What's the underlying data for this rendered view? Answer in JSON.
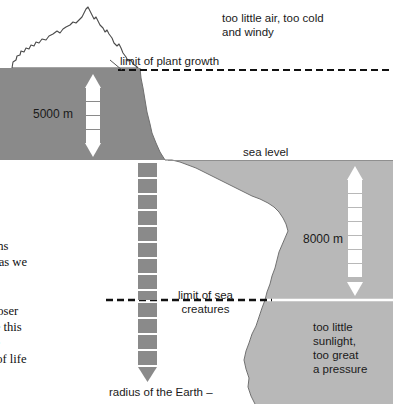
{
  "figure": {
    "colors": {
      "land": "#8a8a8a",
      "sea": "#b8b8b8",
      "outline": "#4a4a4a",
      "dashed_line": "#111111",
      "arrow_white": "#ffffff",
      "arrow_gray": "#8a8a8a",
      "background": "#ffffff",
      "text": "#1a1a1a"
    },
    "captions": {
      "air": "too little air, too cold\nand windy",
      "deep_sea": "too little\nsunlight,\ntoo great\na pressure"
    },
    "labels": {
      "plant_growth": "limit of plant growth",
      "sea_level": "sea level",
      "sea_creatures_line1": "limit of sea",
      "sea_creatures_line2": "creatures",
      "radius": "radius of the Earth –"
    },
    "measurements": {
      "mountain_height": "5000 m",
      "ocean_depth": "8000 m"
    }
  },
  "body_text": "of the oceans\nial for life, as we\nstate over a\n00°C. The\nf planets closer\nvell outside this\nter on these\n the forms of life"
}
